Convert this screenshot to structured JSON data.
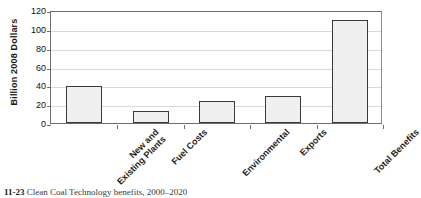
{
  "chart_data": {
    "type": "bar",
    "title": "",
    "xlabel": "",
    "ylabel": "Billion 2008 Dollars",
    "ylim": [
      0,
      120
    ],
    "ytick_step": 20,
    "yticks": [
      120,
      100,
      80,
      60,
      40,
      20,
      0
    ],
    "grid": true,
    "legend": false,
    "categories": [
      "New and Existing Plants",
      "Fuel Costs",
      "Environmental",
      "Exports",
      "Total Benefits"
    ],
    "category_lines": [
      [
        "New and",
        "Existing Plants"
      ],
      [
        "Fuel Costs",
        ""
      ],
      [
        "Environmental",
        ""
      ],
      [
        "Exports",
        ""
      ],
      [
        "Total Benefits",
        ""
      ]
    ],
    "values": [
      39,
      13,
      23,
      29,
      109
    ],
    "bar_fill": "#efefef",
    "bar_edge": "#3a3a3a",
    "gridline_color": "#d9d9d9",
    "axis_color": "#6e6e6e"
  },
  "caption": {
    "figure_number": "11-23",
    "text": "Clean Coal Technology benefits, 2000–2020"
  }
}
